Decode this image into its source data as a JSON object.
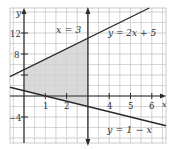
{
  "chart_data": {
    "type": "line",
    "title": "",
    "xlabel": "x",
    "ylabel": "y",
    "xlim": [
      -0.66,
      6.67
    ],
    "ylim": [
      -8.95,
      16.76
    ],
    "grid": true,
    "x_ticks": [
      1,
      2,
      4,
      5,
      6
    ],
    "y_ticks": [
      12,
      8,
      4,
      -4
    ],
    "y_tick_labels": [
      "12",
      "8",
      "",
      "-4"
    ],
    "series": [
      {
        "name": "y = 2x + 5",
        "kind": "line",
        "slope": 2,
        "intercept": 5
      },
      {
        "name": "y = 1 - x",
        "kind": "line",
        "slope": -1,
        "intercept": 1
      },
      {
        "name": "x = 3",
        "kind": "vertical",
        "x": 3
      }
    ],
    "shaded_region": {
      "description": "x >= 0, x <= 3, y >= 1 - x, y <= 2x + 5",
      "vertices": [
        [
          0,
          1
        ],
        [
          0,
          5
        ],
        [
          3,
          11
        ],
        [
          3,
          -2
        ],
        [
          1,
          0
        ]
      ],
      "color": "#d9d9d9"
    },
    "annotations": [
      {
        "text": "x = 3",
        "x": 2.0,
        "y": 12.2
      },
      {
        "text": "y = 2x + 5",
        "x": 4.5,
        "y": 12.0
      },
      {
        "text": "y = 1 − x",
        "x": 3.95,
        "y": -7.0
      }
    ]
  },
  "labels": {
    "y_axis": "y",
    "x_axis": "x",
    "tick_12": "12",
    "tick_8": "8",
    "tick_neg4": "−4",
    "tick_x1": "1",
    "tick_x2": "2",
    "tick_x4": "4",
    "tick_x5": "5",
    "tick_x6": "6",
    "line_x3": "x = 3",
    "line_2x5": "y = 2x + 5",
    "line_1mx": "y = 1 − x"
  },
  "colors": {
    "grid": "#c8c8c8",
    "shade": "#d9d9d9",
    "line": "#2b2b2b",
    "border": "#bdbdbd"
  }
}
